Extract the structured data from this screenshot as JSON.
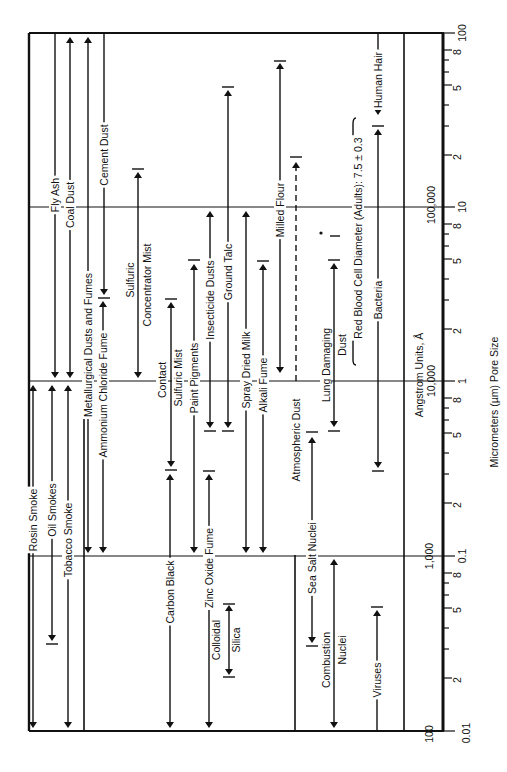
{
  "chart_data": {
    "type": "range-chart",
    "orientation": "rotated-90",
    "title": "",
    "xlabel": "Micrometers (µm)  Pore Size",
    "secondary_axis_label": "Angstrom Units, Å",
    "scale": "log",
    "xlim_um": [
      0.01,
      100
    ],
    "micrometer_ticks": [
      {
        "value": 0.01,
        "label": "0.01"
      },
      {
        "value": 0.02,
        "label": "2"
      },
      {
        "value": 0.05,
        "label": "5"
      },
      {
        "value": 0.08,
        "label": "8"
      },
      {
        "value": 0.1,
        "label": "0.1"
      },
      {
        "value": 0.2,
        "label": "2"
      },
      {
        "value": 0.5,
        "label": "5"
      },
      {
        "value": 0.8,
        "label": "8"
      },
      {
        "value": 1,
        "label": "1"
      },
      {
        "value": 2,
        "label": "2"
      },
      {
        "value": 5,
        "label": "5"
      },
      {
        "value": 8,
        "label": "8"
      },
      {
        "value": 10,
        "label": "10"
      },
      {
        "value": 20,
        "label": "2"
      },
      {
        "value": 50,
        "label": "5"
      },
      {
        "value": 80,
        "label": "8"
      },
      {
        "value": 100,
        "label": "100"
      }
    ],
    "angstrom_ticks": [
      {
        "value_um": 0.01,
        "label": "100"
      },
      {
        "value_um": 0.1,
        "label": "1,000"
      },
      {
        "value_um": 1,
        "label": "10,000"
      },
      {
        "value_um": 10,
        "label": "100,000"
      }
    ],
    "series": [
      {
        "name": "Rosin Smoke",
        "min_um": 0.01,
        "max_um": 1
      },
      {
        "name": "Oil Smokes",
        "min_um": 0.03,
        "max_um": 1
      },
      {
        "name": "Tobacco Smoke",
        "min_um": 0.01,
        "max_um": 1
      },
      {
        "name": "Fly Ash",
        "min_um": 1,
        "max_um": 100
      },
      {
        "name": "Coal Dust",
        "min_um": 1,
        "max_um": 100
      },
      {
        "name": "Metallurgical Dusts and Fumes",
        "min_um": 0.1,
        "max_um": 100
      },
      {
        "name": "Cement Dust",
        "min_um": 3,
        "max_um": 100
      },
      {
        "name": "Ammonium Chloride Fume",
        "min_um": 0.1,
        "max_um": 3
      },
      {
        "name": "Sulfuric Concentrator Mist",
        "min_um": 1,
        "max_um": 20
      },
      {
        "name": "Carbon Black",
        "min_um": 0.01,
        "max_um": 0.3
      },
      {
        "name": "Contact Sulfuric Mist",
        "min_um": 0.3,
        "max_um": 3
      },
      {
        "name": "Colloidal Silica",
        "min_um": 0.03,
        "max_um": 0.06
      },
      {
        "name": "Zinc Oxide Fume",
        "min_um": 0.01,
        "max_um": 0.3
      },
      {
        "name": "Paint Pigments",
        "min_um": 0.1,
        "max_um": 5
      },
      {
        "name": "Insecticide Dusts",
        "min_um": 0.5,
        "max_um": 10
      },
      {
        "name": "Ground Talc",
        "min_um": 0.5,
        "max_um": 50
      },
      {
        "name": "Spray Dried Milk",
        "min_um": 0.1,
        "max_um": 10
      },
      {
        "name": "Alkali Fume",
        "min_um": 0.1,
        "max_um": 5
      },
      {
        "name": "Milled Flour",
        "min_um": 1,
        "max_um": 70
      },
      {
        "name": "Atmospheric Dust",
        "min_um": 0.01,
        "max_um": 20
      },
      {
        "name": "Sea Salt Nuclei",
        "min_um": 0.03,
        "max_um": 0.5
      },
      {
        "name": "Lung Damaging Dust",
        "min_um": 0.5,
        "max_um": 5
      },
      {
        "name": "Combustion Nuclei",
        "min_um": 0.01,
        "max_um": 0.1
      },
      {
        "name": "Red Blood Cell Diameter (Adults): 7.5 ± 0.3",
        "min_um": 7.5,
        "max_um": 7.5
      },
      {
        "name": "Bacteria",
        "min_um": 0.3,
        "max_um": 30
      },
      {
        "name": "Human Hair",
        "min_um": 30,
        "max_um": 30
      },
      {
        "name": "Viruses",
        "min_um": 0.01,
        "max_um": 0.05
      }
    ]
  },
  "labels": {
    "rosin": "Rosin Smoke",
    "oil": "Oil Smokes",
    "tobacco": "Tobacco Smoke",
    "flyash": "Fly Ash",
    "coal": "Coal Dust",
    "metal": "Metallurgical Dusts and Fumes",
    "cement": "Cement Dust",
    "ammonium": "Ammonium Chloride Fume",
    "sulfuric1": "Sulfuric",
    "sulfuric2": "Concentrator Mist",
    "carbon": "Carbon Black",
    "contact1": "Contact",
    "contact2": "Sulfuric Mist",
    "colloidal1": "Colloidal",
    "colloidal2": "Silica",
    "zinc": "Zinc Oxide Fume",
    "paint": "Paint Pigments",
    "insecticide": "Insecticide Dusts",
    "talc": "Ground Talc",
    "milk": "Spray Dried Milk",
    "alkali": "Alkali Fume",
    "flour": "Milled Flour",
    "atmos": "Atmospheric Dust",
    "seasalt": "Sea Salt Nuclei",
    "lung1": "Lung Damaging",
    "lung2": "Dust",
    "combustion1": "Combustion",
    "combustion2": "Nuclei",
    "rbc": "Red Blood Cell Diameter (Adults):  7.5 ± 0.3",
    "bacteria": "Bacteria",
    "hair": "Human Hair",
    "viruses": "Viruses",
    "angstrom": "Angstrom Units, Å",
    "a100": "100",
    "a1000": "1,000",
    "a10000": "10,000",
    "a100000": "100,000",
    "axis_title": "Micrometers (µm)  Pore Size",
    "t001": "0.01",
    "t01": "0.1",
    "t1": "1",
    "t10": "10",
    "t100": "100",
    "t2": "2",
    "t5": "5",
    "t8": "8"
  }
}
